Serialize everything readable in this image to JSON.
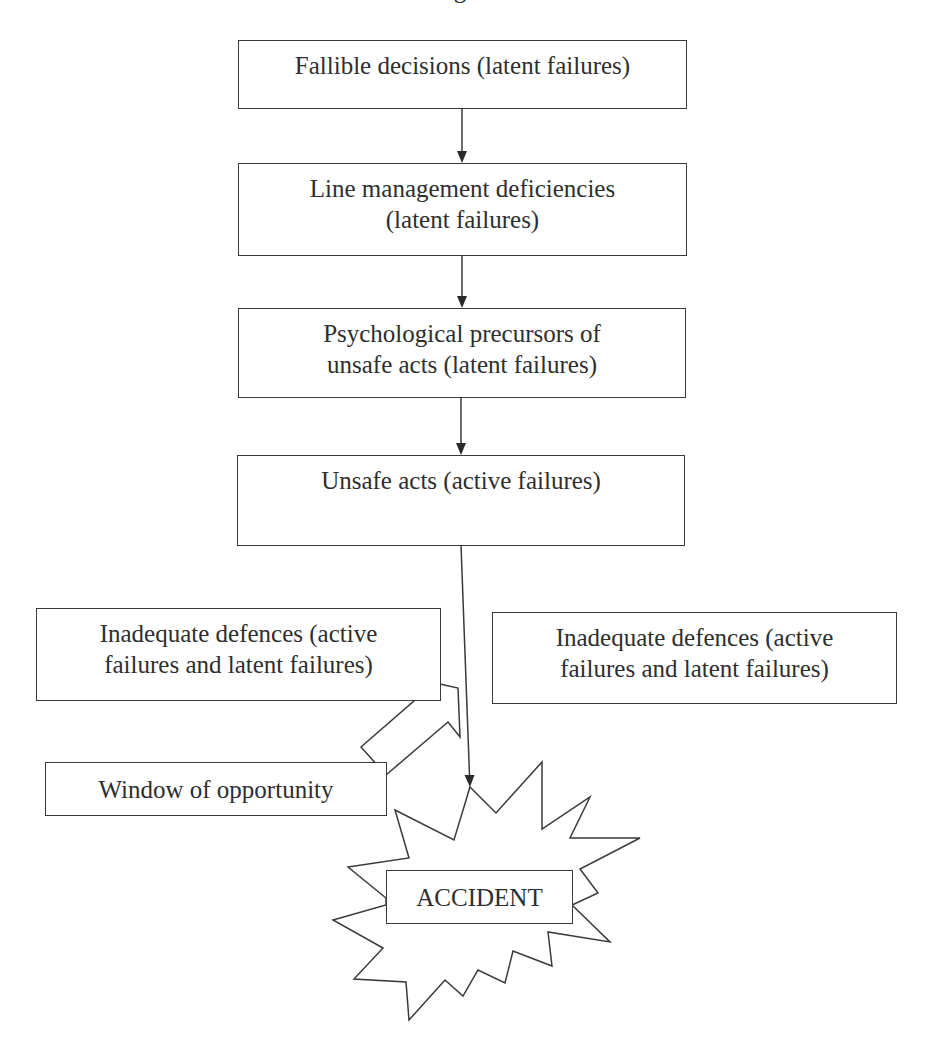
{
  "diagram": {
    "title_partial": "Figure",
    "chain": [
      {
        "id": "fallible-decisions",
        "lines": [
          "Fallible decisions (latent failures)"
        ]
      },
      {
        "id": "line-management",
        "lines": [
          "Line management deficiencies",
          "(latent failures)"
        ]
      },
      {
        "id": "psychological-precursors",
        "lines": [
          "Psychological precursors of",
          "unsafe acts (latent failures)"
        ]
      },
      {
        "id": "unsafe-acts",
        "lines": [
          "Unsafe acts (active failures)"
        ]
      }
    ],
    "defences_left": {
      "lines": [
        "Inadequate defences (active",
        "failures and latent failures)"
      ]
    },
    "defences_right": {
      "lines": [
        "Inadequate defences (active",
        "failures and latent failures)"
      ]
    },
    "window": {
      "label": "Window of opportunity"
    },
    "outcome": {
      "label": "ACCIDENT"
    },
    "colors": {
      "stroke": "#3a3a3a",
      "text": "#2e2e2e",
      "background": "#ffffff"
    }
  }
}
